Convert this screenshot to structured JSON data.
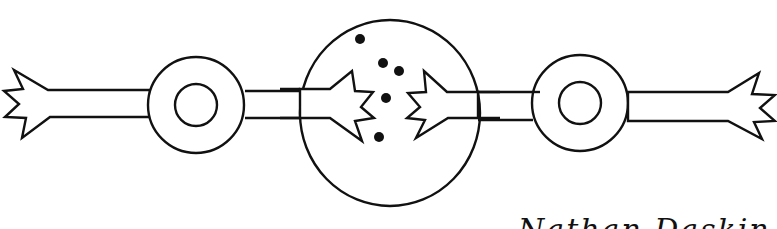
{
  "diagram": {
    "stroke_color": "#111111",
    "background": "#ffffff",
    "elements": {
      "left_hand_outer": {
        "side": "left",
        "type": "jagged-hand"
      },
      "left_ring": {
        "cx": 196,
        "cy": 105,
        "outer_r": 48,
        "inner_r": 21
      },
      "central_circle": {
        "cx": 390,
        "cy": 113,
        "rx": 90,
        "ry": 93
      },
      "right_ring": {
        "cx": 580,
        "cy": 103,
        "outer_r": 48,
        "inner_r": 21
      },
      "right_hand_outer": {
        "side": "right",
        "type": "jagged-hand"
      },
      "dots": [
        {
          "cx": 360,
          "cy": 39
        },
        {
          "cx": 383,
          "cy": 63
        },
        {
          "cx": 399,
          "cy": 71
        },
        {
          "cx": 386,
          "cy": 98
        },
        {
          "cx": 379,
          "cy": 137
        }
      ]
    }
  },
  "caption": {
    "left_fragment": "",
    "right_fragment": "Nathan Daskin",
    "note": "Caption text is cut off at the bottom edge; only tops of glyphs visible"
  }
}
